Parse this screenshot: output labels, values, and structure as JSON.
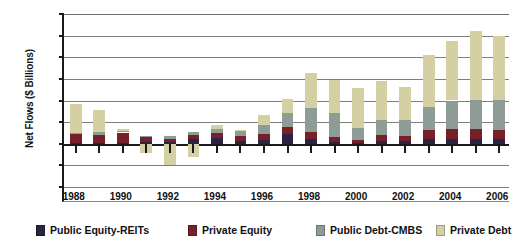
{
  "chart_data": {
    "type": "bar",
    "stacked": true,
    "title": "",
    "xlabel": "",
    "ylabel": "Net Flows ($ Billions)",
    "ylim": [
      -100,
      300
    ],
    "ytick_step": 50,
    "yticks": [
      "300",
      "250",
      "200",
      "150",
      "100",
      "50",
      "0",
      "-50",
      "-100"
    ],
    "grid": true,
    "legend_position": "bottom",
    "categories": [
      "1988",
      "1989",
      "1990",
      "1991",
      "1992",
      "1993",
      "1994",
      "1995",
      "1996",
      "1997",
      "1998",
      "1999",
      "2000",
      "2001",
      "2002",
      "2003",
      "2004",
      "2005",
      "2006"
    ],
    "tick_labels": [
      "1988",
      "",
      "1990",
      "",
      "1992",
      "",
      "1994",
      "",
      "1996",
      "",
      "1998",
      "",
      "2000",
      "",
      "2002",
      "",
      "2004",
      "",
      "2006"
    ],
    "series": [
      {
        "name": "Public Equity-REITs",
        "color": "#2b2340",
        "values": [
          2,
          2,
          2,
          4,
          4,
          12,
          14,
          6,
          8,
          22,
          12,
          4,
          2,
          6,
          6,
          10,
          10,
          10,
          10
        ]
      },
      {
        "name": "Private Equity",
        "color": "#76202c",
        "values": [
          20,
          18,
          24,
          12,
          8,
          8,
          10,
          12,
          14,
          16,
          16,
          12,
          6,
          14,
          12,
          22,
          24,
          24,
          22
        ]
      },
      {
        "name": "Public Debt-CMBS",
        "color": "#8e9c96",
        "values": [
          2,
          8,
          4,
          2,
          6,
          8,
          10,
          12,
          22,
          34,
          54,
          56,
          28,
          36,
          36,
          54,
          66,
          68,
          70
        ]
      },
      {
        "name": "Private Debt",
        "color": "#d5d0a4",
        "values": [
          68,
          50,
          4,
          -22,
          -48,
          -30,
          10,
          2,
          22,
          32,
          82,
          76,
          92,
          88,
          78,
          120,
          138,
          158,
          146
        ]
      }
    ],
    "negative_values": {
      "1991": -22,
      "1992": -48,
      "1993": -30
    }
  },
  "legend": {
    "items": [
      {
        "label": "Public Equity-REITs",
        "color": "#2b2340"
      },
      {
        "label": "Private Equity",
        "color": "#76202c"
      },
      {
        "label": "Public Debt-CMBS",
        "color": "#8e9c96"
      },
      {
        "label": "Private Debt",
        "color": "#d5d0a4"
      }
    ]
  }
}
